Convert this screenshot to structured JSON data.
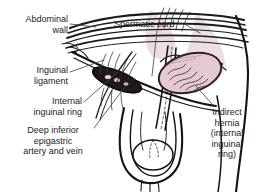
{
  "figure": {
    "background_color": "#ffffff",
    "width": 262,
    "height": 192
  },
  "colors": {
    "ink": "#1b1b1b",
    "outline": "#111111",
    "hernia_sac_fill": "#e3c6cf",
    "hernia_sac_stroke": "#3a2730",
    "tissue_tint": "#d9bcc6",
    "leader_line": "#4a4a4a"
  },
  "labels": {
    "abdominal_wall": "Abdominal\nwall",
    "spermatic_cord": "Spermatic cord",
    "inguinal_ligament": "Inguinal\nligament",
    "internal_inguinal_ring": "Internal\ninguinal ring",
    "deep_inferior_epigastric": "Deep inferior\nepigastric\nartery and vein",
    "indirect_hernia": "Indirect\nhernia\n(internal\ninguinal\nring)"
  },
  "structures": [
    {
      "name": "abdominal-wall",
      "description": "Layered parallel curved lines of the lower abdominal wall sweeping from upper left to right"
    },
    {
      "name": "inguinal-ligament",
      "description": "Band running obliquely from anterior superior iliac spine to pubic tubercle"
    },
    {
      "name": "internal-inguinal-ring",
      "description": "Dark elongated ring opening on the left side of the figure"
    },
    {
      "name": "deep-inferior-epigastric-vessels",
      "description": "Artery and vein ascending medial to the internal ring"
    },
    {
      "name": "spermatic-cord",
      "description": "Cord descending from the internal ring through the inguinal canal into the scrotum"
    },
    {
      "name": "indirect-hernia-sac",
      "description": "Shaded oval sac protruding through the internal inguinal ring"
    },
    {
      "name": "scrotum",
      "description": "Scrotal sac outline with testis at the lower center of the figure"
    }
  ]
}
